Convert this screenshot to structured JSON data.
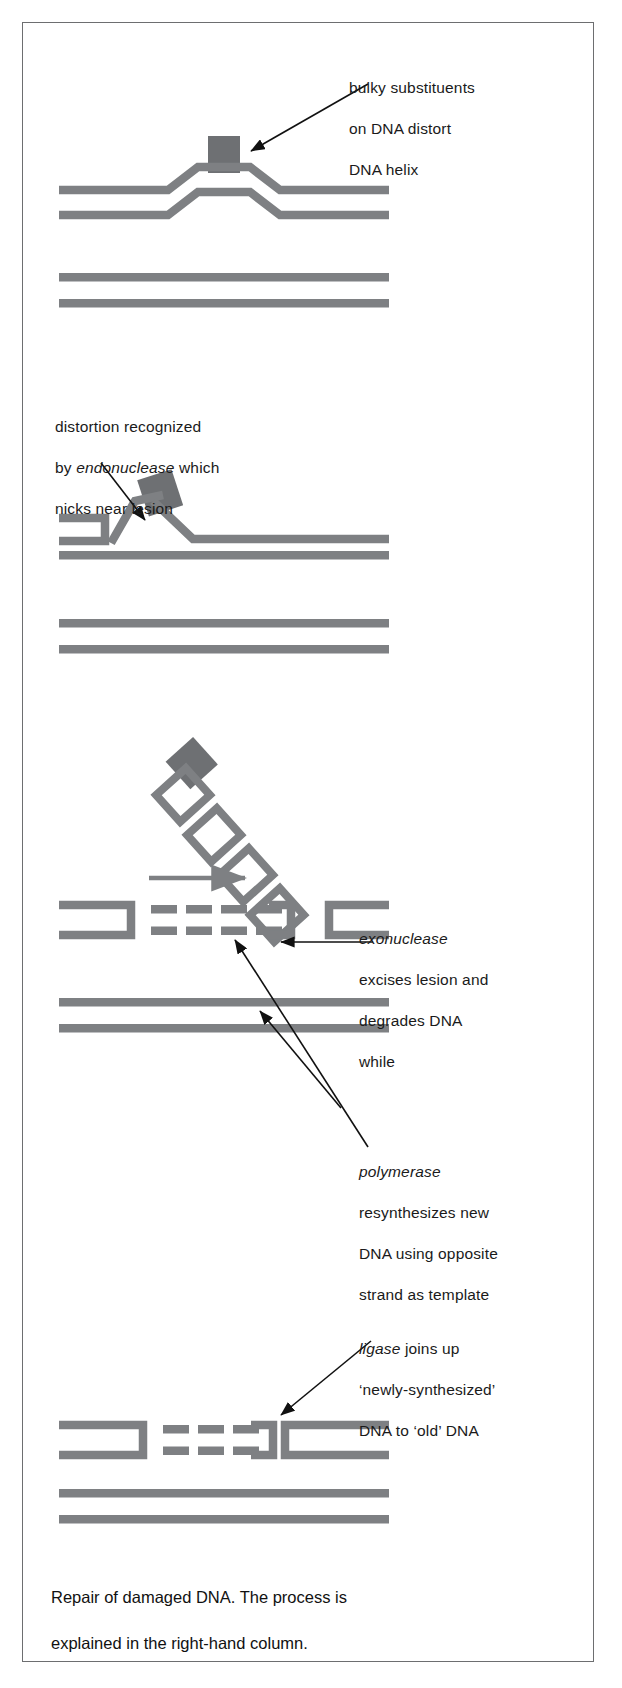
{
  "figure": {
    "title": "Repair of damaged DNA",
    "bottom_caption": "Repair of damaged DNA. The process is\nexplained in the right-hand column.",
    "colors": {
      "dna_strand": "#7e8083",
      "lesion_block": "#6e7073",
      "frame": "#6d6e70",
      "text": "#1a1a1a",
      "arrow": "#111111",
      "background": "#ffffff"
    }
  },
  "panels": [
    {
      "id": "panel-1",
      "step": 1,
      "caption_lines": "bulky substituents\non DNA distort\nDNA helix",
      "caption_italic_term": "",
      "description": "Double-stranded DNA with a bulky substituent block bulging the helix; a second undamaged duplex lies below."
    },
    {
      "id": "panel-2",
      "step": 2,
      "caption_lines": "distortion recognized\nby endonuclease which\nnicks near lesion",
      "caption_italic_term": "endonuclease",
      "description": "Endonuclease nicks the damaged strand near the lesion, lifting the strand end away from the duplex."
    },
    {
      "id": "panel-3",
      "step": 3,
      "caption_lines": "exonuclease\nexcises lesion and\ndegrades DNA",
      "caption_italic_term": "exonuclease",
      "description": "Exonuclease peels off a diagonal chain of nucleotides carrying the lesion away from the gapped duplex."
    },
    {
      "id": "panel-3b",
      "step": 3,
      "caption_lines": "while",
      "caption_italic_term": "",
      "description": "Connector word joining the exonuclease and polymerase steps."
    },
    {
      "id": "panel-3c",
      "step": 4,
      "caption_lines": "polymerase\nresynthesizes new\nDNA using opposite\nstrand as template",
      "caption_italic_term": "polymerase",
      "description": "Polymerase fills the gap with newly synthesized DNA shown as dashed segments."
    },
    {
      "id": "panel-4",
      "step": 5,
      "caption_lines": "ligase joins up\n'newly-synthesized'\nDNA to 'old' DNA",
      "caption_italic_term": "ligase",
      "description": "Ligase seals the newly synthesized DNA to the old DNA, restoring an intact duplex."
    }
  ],
  "labels": {
    "bulky_line1": "bulky substituents",
    "bulky_line2": "on DNA distort",
    "bulky_line3": "DNA helix",
    "endo_line1": "distortion recognized",
    "endo_line2_pre": "by ",
    "endo_line2_em": "endonuclease",
    "endo_line2_post": " which",
    "endo_line3": "nicks near lesion",
    "exo_line1_em": "exonuclease",
    "exo_line2": "excises lesion and",
    "exo_line3": "degrades DNA",
    "while_word": "while",
    "poly_line1_em": "polymerase",
    "poly_line2": "resynthesizes new",
    "poly_line3": "DNA using opposite",
    "poly_line4": "strand as template",
    "ligase_line1_em": "ligase",
    "ligase_line1_post": " joins up",
    "ligase_line2": "‘newly-synthesized’",
    "ligase_line3": "DNA to ‘old’ DNA",
    "bottom_line1": "Repair of damaged DNA. The process is",
    "bottom_line2": "explained in the right-hand column."
  }
}
